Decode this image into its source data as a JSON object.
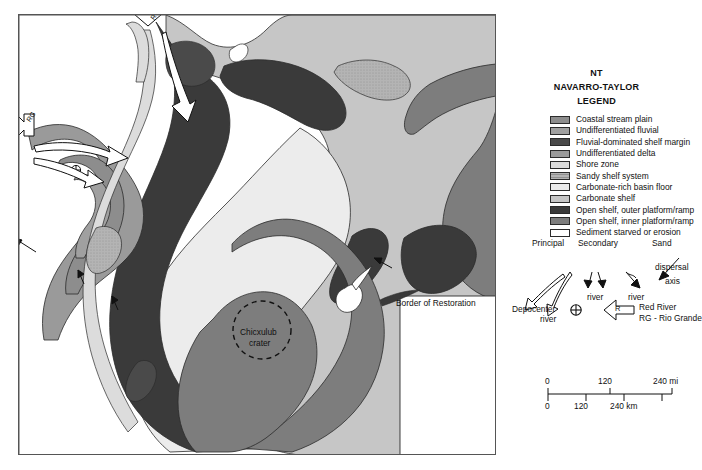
{
  "figure": {
    "kind": "paleogeographic-map",
    "background": "#ffffff"
  },
  "legend": {
    "title_line1": "NT",
    "title_line2": "NAVARRO-TAYLOR",
    "title_line3": "LEGEND",
    "items": [
      {
        "label": "Coastal stream plain",
        "color": "#8d8d8d",
        "pattern": "solid"
      },
      {
        "label": "Undifferentiated fluvial",
        "color": "#a0a0a0",
        "pattern": "solid"
      },
      {
        "label": "Fluvial-dominated shelf margin",
        "color": "#4a4a4a",
        "pattern": "solid"
      },
      {
        "label": "Undifferentiated delta",
        "color": "#9a9a9a",
        "pattern": "solid"
      },
      {
        "label": "Shore zone",
        "color": "#dcdcdc",
        "pattern": "solid"
      },
      {
        "label": "Sandy shelf system",
        "color": "#b4b4b4",
        "pattern": "stipple"
      },
      {
        "label": "Carbonate-rich basin floor",
        "color": "#ececec",
        "pattern": "solid"
      },
      {
        "label": "Carbonate shelf",
        "color": "#c6c6c6",
        "pattern": "solid"
      },
      {
        "label": "Open shelf, outer platform/ramp",
        "color": "#3a3a3a",
        "pattern": "solid"
      },
      {
        "label": "Open shelf, inner platform/ramp",
        "color": "#7d7d7d",
        "pattern": "solid"
      },
      {
        "label": "Sediment starved or erosion",
        "color": "#ffffff",
        "pattern": "solid"
      }
    ]
  },
  "symbol_key": {
    "principal_line1": "Principal",
    "principal_line2": "river",
    "secondary_line1": "Secondary",
    "secondary_line2": "river",
    "secondary_alt_line2": "river",
    "sand_line1": "Sand",
    "sand_line2": "dispersal",
    "sand_line3": "axis",
    "depocenter_label": "Depocenter",
    "river_letter": "R",
    "red_river_label": "Red River",
    "rio_grande_label": "RG - Rio Grande"
  },
  "scale": {
    "miles": {
      "ticks": [
        "0",
        "120",
        "240 mi"
      ],
      "unit": "mi"
    },
    "km": {
      "ticks": [
        "0",
        "120",
        "240 km"
      ],
      "unit": "km"
    }
  },
  "map_labels": {
    "border_of_restoration": "Border of Restoration",
    "crater_line1": "Chicxulub",
    "crater_line2": "crater",
    "rio_grande_tag": "RG",
    "red_river_tag": "R"
  },
  "colors": {
    "coastal_stream_plain": "#8d8d8d",
    "undiff_fluvial": "#a0a0a0",
    "fluvial_shelf_margin": "#4a4a4a",
    "undiff_delta": "#9a9a9a",
    "shore_zone": "#dcdcdc",
    "sandy_shelf": "#b4b4b4",
    "carbonate_basin_floor": "#ececec",
    "carbonate_shelf": "#c6c6c6",
    "open_shelf_outer": "#3a3a3a",
    "open_shelf_inner": "#7d7d7d",
    "sediment_starved": "#ffffff",
    "outline": "#2b2b2b",
    "frame": "#555555"
  }
}
